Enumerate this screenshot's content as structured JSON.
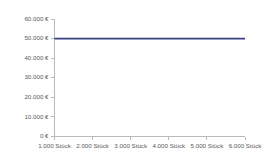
{
  "chart_data": {
    "type": "line",
    "title": "",
    "subtitle": "",
    "xlabel": "",
    "ylabel": "",
    "grid": false,
    "legend": false,
    "legend_position": "none",
    "line_color": "#36407f",
    "axis_color": "#b9b9b9",
    "tick_label_color": "#5a5a5a",
    "background_color": "#ffffff",
    "x": [
      1000,
      2000,
      3000,
      4000,
      5000,
      6000
    ],
    "categories": [
      "1.000 Stück",
      "2.000 Stück",
      "3.000 Stück",
      "4.000 Stück",
      "5.000 Stück",
      "6.000 Stück"
    ],
    "series": [
      {
        "name": "Fixkosten",
        "values": [
          50000,
          50000,
          50000,
          50000,
          50000,
          50000
        ]
      }
    ],
    "xlim": [
      1000,
      6000
    ],
    "ylim": [
      0,
      60000
    ],
    "y_ticks": [
      0,
      10000,
      20000,
      30000,
      40000,
      50000,
      60000
    ],
    "y_tick_labels": [
      "0 €",
      "10.000 €",
      "20.000 €",
      "30.000 €",
      "40.000 €",
      "50.000 €",
      "60.000 €"
    ],
    "x_ticks": [
      1000,
      2000,
      3000,
      4000,
      5000,
      6000
    ],
    "x_tick_labels": [
      "1.000 Stück",
      "2.000 Stück",
      "3.000 Stück",
      "4.000 Stück",
      "5.000 Stück",
      "6.000 Stück"
    ]
  }
}
